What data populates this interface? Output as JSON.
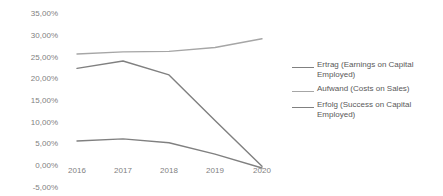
{
  "chart_data": {
    "type": "line",
    "title": "",
    "xlabel": "",
    "ylabel": "",
    "categories": [
      "2016",
      "2017",
      "2018",
      "2019",
      "2020"
    ],
    "x": [
      2016,
      2017,
      2018,
      2019,
      2020
    ],
    "ylim": [
      -5,
      35
    ],
    "ytick_labels": [
      "35,00%",
      "30,00%",
      "25,00%",
      "20,00%",
      "15,00%",
      "10,00%",
      "5,00%",
      "0,00%",
      "-5,00%"
    ],
    "ytick_values": [
      35,
      30,
      25,
      20,
      15,
      10,
      5,
      0,
      -5
    ],
    "grid": false,
    "legend_position": "right",
    "series": [
      {
        "name": "Ertrag (Earnings on Capital Employed)",
        "color": "#808080",
        "values": [
          22.5,
          24.2,
          21.0,
          10.5,
          0.0
        ]
      },
      {
        "name": "Aufwand (Costs on Sales)",
        "color": "#a6a6a6",
        "values": [
          25.8,
          26.3,
          26.4,
          27.3,
          29.3
        ]
      },
      {
        "name": "Erfolg (Success on Capital Employed)",
        "color": "#808080",
        "values": [
          5.8,
          6.3,
          5.4,
          2.8,
          -0.4
        ]
      }
    ]
  },
  "axis": {
    "y": {
      "t0": "35,00%",
      "t1": "30,00%",
      "t2": "25,00%",
      "t3": "20,00%",
      "t4": "15,00%",
      "t5": "10,00%",
      "t6": "5,00%",
      "t7": "0,00%",
      "t8": "-5,00%"
    },
    "x": {
      "t0": "2016",
      "t1": "2017",
      "t2": "2018",
      "t3": "2019",
      "t4": "2020"
    }
  },
  "legend": {
    "items": [
      {
        "label": "Ertrag (Earnings on Capital Employed)",
        "color": "#808080"
      },
      {
        "label": "Aufwand (Costs on Sales)",
        "color": "#a6a6a6"
      },
      {
        "label": "Erfolg (Success on Capital Employed)",
        "color": "#808080"
      }
    ]
  }
}
